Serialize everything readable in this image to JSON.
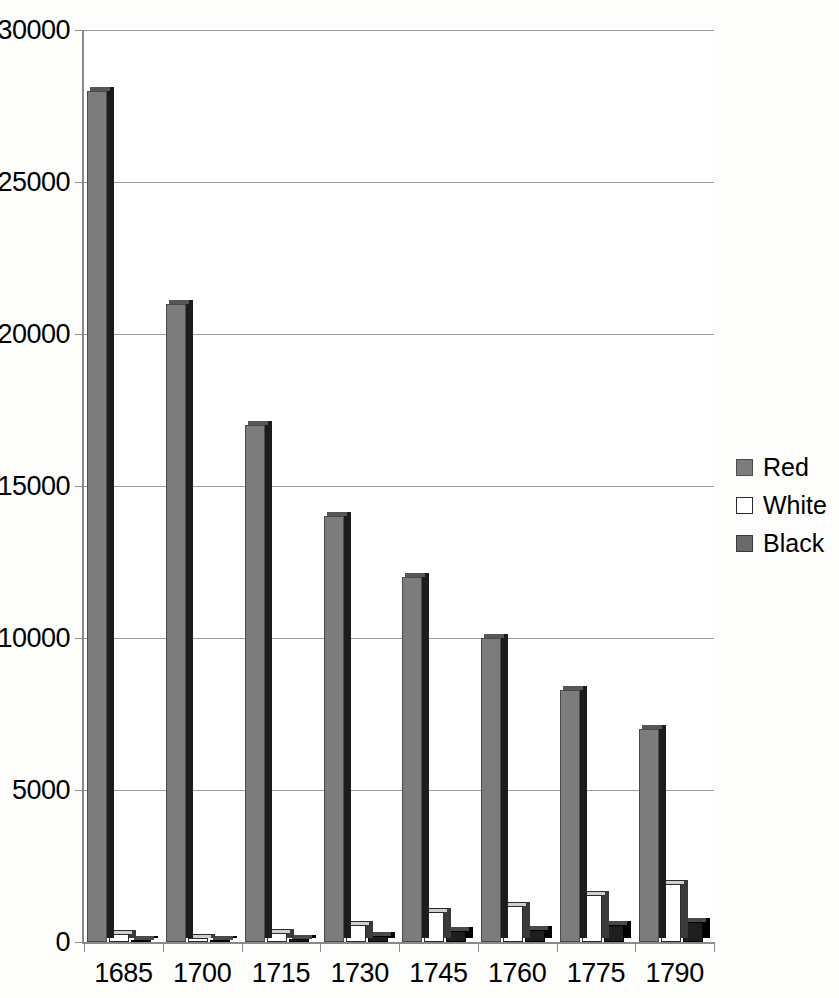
{
  "chart_data": {
    "type": "bar",
    "title": "",
    "subtitle": "",
    "xlabel": "",
    "ylabel": "",
    "categories": [
      "1685",
      "1700",
      "1715",
      "1730",
      "1745",
      "1760",
      "1775",
      "1790"
    ],
    "series": [
      {
        "name": "Red",
        "color": "#7c7c7c",
        "values": [
          28000,
          21000,
          17000,
          14000,
          12000,
          10000,
          8300,
          7000
        ]
      },
      {
        "name": "White",
        "color": "#ffffff",
        "values": [
          250,
          120,
          300,
          550,
          1000,
          1200,
          1550,
          1900
        ]
      },
      {
        "name": "Black",
        "color": "#1e1e1e",
        "values": [
          80,
          70,
          100,
          200,
          350,
          400,
          550,
          650
        ]
      }
    ],
    "ylim": [
      0,
      30000
    ],
    "yticks": [
      0,
      5000,
      10000,
      15000,
      20000,
      25000,
      30000
    ],
    "ytick_labels": [
      "0",
      "5000",
      "10000",
      "15000",
      "20000",
      "25000",
      "30000"
    ],
    "grid": true,
    "grid_axis": "y",
    "legend_position": "right",
    "legend_entries": [
      "Red",
      "White",
      "Black"
    ],
    "style": "3d-column"
  },
  "axes": {
    "y_axis_name": "y-axis",
    "x_axis_name": "x-axis"
  }
}
